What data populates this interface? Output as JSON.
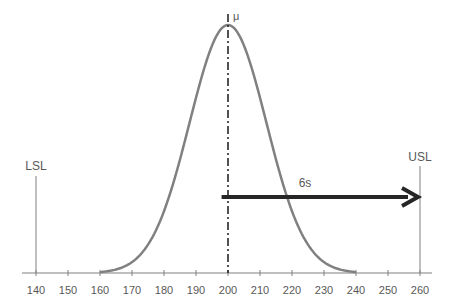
{
  "chart_data": {
    "type": "line",
    "title": "",
    "xlabel": "",
    "ylabel": "",
    "xlim": [
      140,
      260
    ],
    "x_ticks": [
      140,
      150,
      160,
      170,
      180,
      190,
      200,
      210,
      220,
      230,
      240,
      250,
      260
    ],
    "grid": false,
    "series": [
      {
        "name": "Normal distribution",
        "mean": 200,
        "sd": 12,
        "color": "#808080"
      }
    ],
    "annotations": {
      "mean_label": "μ",
      "mean_x": 200,
      "lsl_label": "LSL",
      "lsl_x": 140,
      "usl_label": "USL",
      "usl_x": 260,
      "arrow_label": "6s",
      "arrow_from": 198,
      "arrow_to": 259
    },
    "colors": {
      "curve": "#808080",
      "axis": "#808080",
      "arrow": "#262626",
      "text": "#595959",
      "mean_line": "#1a1a1a"
    }
  }
}
